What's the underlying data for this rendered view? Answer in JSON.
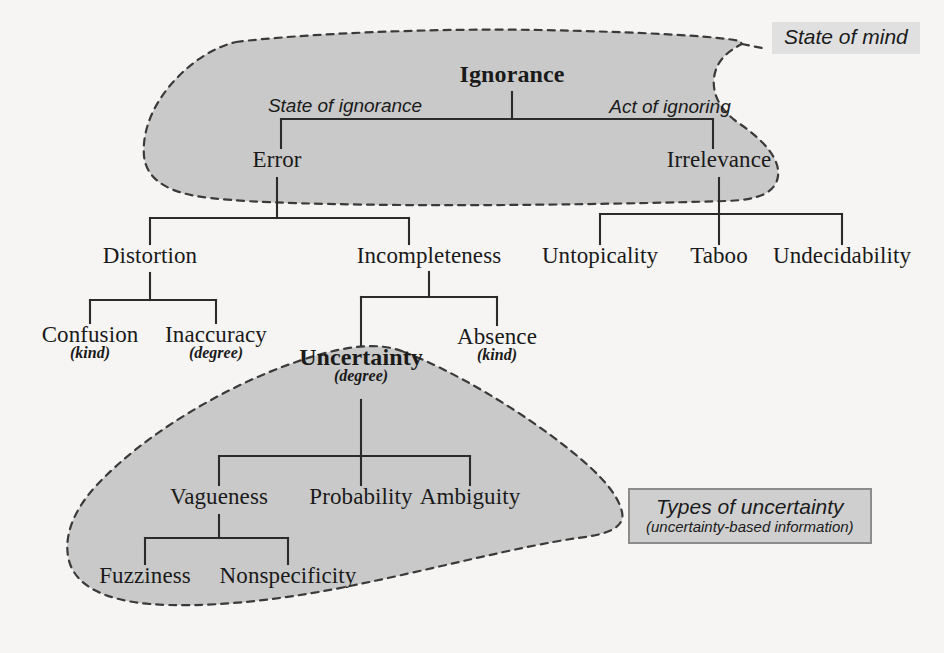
{
  "figure": {
    "background_color": "#f6f5f3",
    "blob_fill_color": "#c9c9c9",
    "blob_stroke_color": "#3a3a3a",
    "line_color": "#2b2b2b",
    "callout_fill_color": "#dcdcdc"
  },
  "nodes": {
    "ignorance": {
      "label": "Ignorance",
      "qualifier": ""
    },
    "error": {
      "label": "Error",
      "qualifier": ""
    },
    "irrelevance": {
      "label": "Irrelevance",
      "qualifier": ""
    },
    "distortion": {
      "label": "Distortion",
      "qualifier": ""
    },
    "incompleteness": {
      "label": "Incompleteness",
      "qualifier": ""
    },
    "untopicality": {
      "label": "Untopicality",
      "qualifier": ""
    },
    "taboo": {
      "label": "Taboo",
      "qualifier": ""
    },
    "undecidability": {
      "label": "Undecidability",
      "qualifier": ""
    },
    "confusion": {
      "label": "Confusion",
      "qualifier": "(kind)"
    },
    "inaccuracy": {
      "label": "Inaccuracy",
      "qualifier": "(degree)"
    },
    "uncertainty": {
      "label": "Uncertainty",
      "qualifier": "(degree)"
    },
    "absence": {
      "label": "Absence",
      "qualifier": "(kind)"
    },
    "vagueness": {
      "label": "Vagueness",
      "qualifier": ""
    },
    "probability": {
      "label": "Probability",
      "qualifier": ""
    },
    "ambiguity": {
      "label": "Ambiguity",
      "qualifier": ""
    },
    "fuzziness": {
      "label": "Fuzziness",
      "qualifier": ""
    },
    "nonspecificity": {
      "label": "Nonspecificity",
      "qualifier": ""
    }
  },
  "edge_labels": {
    "state_of_ignorance": "State of ignorance",
    "act_of_ignoring": "Act of ignoring"
  },
  "callouts": {
    "state_of_mind": "State of mind",
    "types_of_uncertainty_line1": "Types of uncertainty",
    "types_of_uncertainty_line2": "(uncertainty-based information)"
  },
  "hierarchy": {
    "root": "Ignorance",
    "edges": [
      {
        "from": "Ignorance",
        "to": "Error",
        "label": "State of ignorance"
      },
      {
        "from": "Ignorance",
        "to": "Irrelevance",
        "label": "Act of ignoring"
      },
      {
        "from": "Error",
        "to": "Distortion",
        "label": ""
      },
      {
        "from": "Error",
        "to": "Incompleteness",
        "label": ""
      },
      {
        "from": "Irrelevance",
        "to": "Untopicality",
        "label": ""
      },
      {
        "from": "Irrelevance",
        "to": "Taboo",
        "label": ""
      },
      {
        "from": "Irrelevance",
        "to": "Undecidability",
        "label": ""
      },
      {
        "from": "Distortion",
        "to": "Confusion",
        "label": ""
      },
      {
        "from": "Distortion",
        "to": "Inaccuracy",
        "label": ""
      },
      {
        "from": "Incompleteness",
        "to": "Uncertainty",
        "label": ""
      },
      {
        "from": "Incompleteness",
        "to": "Absence",
        "label": ""
      },
      {
        "from": "Uncertainty",
        "to": "Vagueness",
        "label": ""
      },
      {
        "from": "Uncertainty",
        "to": "Probability",
        "label": ""
      },
      {
        "from": "Uncertainty",
        "to": "Ambiguity",
        "label": ""
      },
      {
        "from": "Vagueness",
        "to": "Fuzziness",
        "label": ""
      },
      {
        "from": "Vagueness",
        "to": "Nonspecificity",
        "label": ""
      }
    ]
  }
}
